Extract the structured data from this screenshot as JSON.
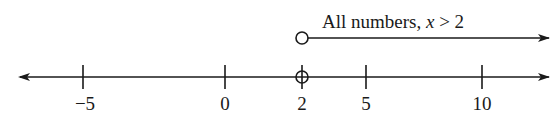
{
  "diagram": {
    "type": "number-line",
    "axis": {
      "min_visible": -7,
      "max_visible": 11.7,
      "arrows": [
        "left",
        "right"
      ],
      "ticks": [
        {
          "value": -5,
          "label": "−5"
        },
        {
          "value": 0,
          "label": "0"
        },
        {
          "value": 2,
          "label": "2"
        },
        {
          "value": 5,
          "label": "5"
        },
        {
          "value": 10,
          "label": "10"
        }
      ],
      "open_point": {
        "value": 2
      }
    },
    "ray": {
      "start_value": 2,
      "start_marker": "open-circle",
      "direction": "right",
      "label_prefix": "All numbers, ",
      "label_var": "x",
      "label_suffix": " > 2"
    },
    "colors": {
      "stroke": "#1a1a1a",
      "background": "#ffffff"
    }
  }
}
